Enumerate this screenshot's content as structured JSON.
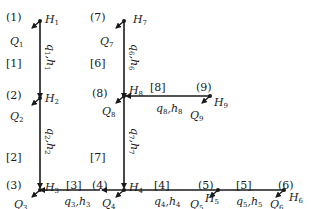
{
  "diagram": {
    "title": "",
    "nodes": [
      {
        "id": "1",
        "label": "(1)",
        "head": "H",
        "head_sub": "1",
        "flow": "Q",
        "flow_sub": "1"
      },
      {
        "id": "2",
        "label": "(2)",
        "head": "H",
        "head_sub": "2",
        "flow": "Q",
        "flow_sub": "2"
      },
      {
        "id": "3",
        "label": "(3)",
        "head": "H",
        "head_sub": "3",
        "flow": "Q",
        "flow_sub": "3"
      },
      {
        "id": "4",
        "label": "(4)",
        "head": "H",
        "head_sub": "4",
        "flow": "Q",
        "flow_sub": "4"
      },
      {
        "id": "5",
        "label": "(5)",
        "head": "H",
        "head_sub": "5",
        "flow": "Q",
        "flow_sub": "5"
      },
      {
        "id": "6",
        "label": "(6)",
        "head": "H",
        "head_sub": "6",
        "flow": "Q",
        "flow_sub": "6"
      },
      {
        "id": "7",
        "label": "(7)",
        "head": "H",
        "head_sub": "7",
        "flow": "Q",
        "flow_sub": "7"
      },
      {
        "id": "8",
        "label": "(8)",
        "head": "H",
        "head_sub": "8",
        "flow": "Q",
        "flow_sub": "8"
      },
      {
        "id": "9",
        "label": "(9)",
        "head": "H",
        "head_sub": "9",
        "flow": "Q",
        "flow_sub": "9"
      }
    ],
    "pipes": [
      {
        "id": "1",
        "label": "[1]",
        "from": "1",
        "to": "2",
        "q": "q",
        "q_sub": "1",
        "h": "h",
        "h_sub": "1"
      },
      {
        "id": "2",
        "label": "[2]",
        "from": "2",
        "to": "3",
        "q": "q",
        "q_sub": "2",
        "h": "h",
        "h_sub": "2"
      },
      {
        "id": "3",
        "label": "[3]",
        "from": "4",
        "to": "3",
        "q": "q",
        "q_sub": "3",
        "h": "h",
        "h_sub": "3"
      },
      {
        "id": "4",
        "label": "[4]",
        "from": "5",
        "to": "4",
        "q": "q",
        "q_sub": "4",
        "h": "h",
        "h_sub": "4"
      },
      {
        "id": "5",
        "label": "[5]",
        "from": "6",
        "to": "5",
        "q": "q",
        "q_sub": "5",
        "h": "h",
        "h_sub": "5"
      },
      {
        "id": "6",
        "label": "[6]",
        "from": "7",
        "to": "8",
        "q": "q",
        "q_sub": "6",
        "h": "h",
        "h_sub": "6"
      },
      {
        "id": "7",
        "label": "[7]",
        "from": "8",
        "to": "4",
        "q": "q",
        "q_sub": "7",
        "h": "h",
        "h_sub": "7"
      },
      {
        "id": "8",
        "label": "[8]",
        "from": "9",
        "to": "8",
        "q": "q",
        "q_sub": "8",
        "h": "h",
        "h_sub": "8"
      }
    ],
    "colors": {
      "line": "#1a1a1a",
      "background": "#ffffff"
    }
  }
}
